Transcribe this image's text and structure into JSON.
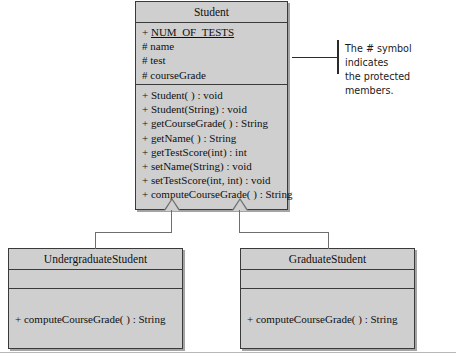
{
  "diagram": {
    "type": "uml-class-diagram",
    "classes": [
      {
        "id": "student",
        "name": "Student",
        "attributes": [
          {
            "visibility": "+",
            "name": "NUM_OF_TESTS",
            "static": true
          },
          {
            "visibility": "#",
            "name": "name",
            "static": false
          },
          {
            "visibility": "#",
            "name": "test",
            "static": false
          },
          {
            "visibility": "#",
            "name": "courseGrade",
            "static": false
          }
        ],
        "methods": [
          "+ Student( ) : void",
          "+ Student(String) : void",
          "+ getCourseGrade( ) : String",
          "+ getName( ) : String",
          "+ getTestScore(int) : int",
          "+ setName(String) : void",
          "+ setTestScore(int, int) : void",
          "+ computeCourseGrade( ) : String"
        ]
      },
      {
        "id": "undergraduate",
        "name": "UndergraduateStudent",
        "attributes": [],
        "methods": [
          "+ computeCourseGrade( ) : String"
        ]
      },
      {
        "id": "graduate",
        "name": "GraduateStudent",
        "attributes": [],
        "methods": [
          "+ computeCourseGrade( ) : String"
        ]
      }
    ],
    "relationships": [
      {
        "type": "generalization",
        "from": "undergraduate",
        "to": "student"
      },
      {
        "type": "generalization",
        "from": "graduate",
        "to": "student"
      }
    ],
    "annotations": [
      {
        "id": "protected-note",
        "line1": "The # symbol indicates",
        "line2": "the protected members.",
        "target": "student"
      }
    ],
    "colors": {
      "box_fill": "#cfcfcf",
      "box_border": "#3a3a3a",
      "connector": "#6e6e6e",
      "text": "#101010",
      "annotation_text": "#1a1a1a",
      "page_background": "#ffffff"
    }
  }
}
